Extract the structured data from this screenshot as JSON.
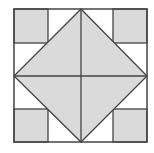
{
  "diagram": {
    "type": "geometric-quilt-pattern",
    "colors": {
      "fill": "#dadada",
      "stroke": "#444444",
      "background": "#ffffff"
    },
    "outer_square": {
      "x": 14,
      "y": 9,
      "size": 133
    },
    "corner_squares": [
      {
        "name": "top-left",
        "x": 14,
        "y": 9,
        "w": 34,
        "h": 34
      },
      {
        "name": "top-right",
        "x": 113,
        "y": 9,
        "w": 34,
        "h": 34
      },
      {
        "name": "bottom-left",
        "x": 14,
        "y": 109,
        "w": 34,
        "h": 33
      },
      {
        "name": "bottom-right",
        "x": 113,
        "y": 109,
        "w": 34,
        "h": 33
      }
    ],
    "diamond": {
      "top": [
        81,
        9
      ],
      "right": [
        147,
        76
      ],
      "bottom": [
        81,
        142
      ],
      "left": [
        14,
        76
      ]
    },
    "center": [
      81,
      76
    ]
  }
}
